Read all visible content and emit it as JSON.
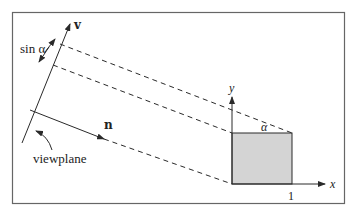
{
  "diagram": {
    "labels": {
      "v_axis": "v",
      "normal": "n",
      "sin_alpha": "sin α",
      "viewplane": "viewplane",
      "y_axis": "y",
      "x_axis": "x",
      "alpha": "α",
      "unit_tick": "1"
    },
    "colors": {
      "stroke": "#2a2a2a",
      "square_fill": "#d4d4d4",
      "frame": "#555555",
      "background": "#ffffff"
    }
  }
}
